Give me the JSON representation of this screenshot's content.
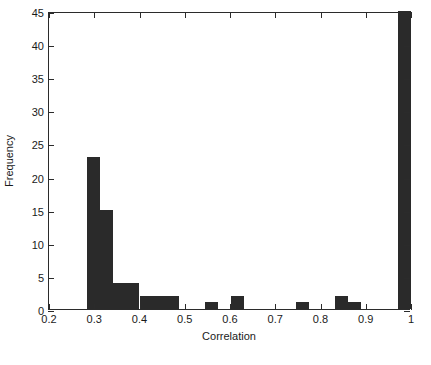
{
  "chart_data": {
    "type": "bar",
    "title": "",
    "subtitle": "",
    "xlabel": "Correlation",
    "ylabel": "Frequency",
    "xlim": [
      0.2,
      1.0
    ],
    "ylim": [
      0,
      45
    ],
    "grid": false,
    "legend": null,
    "legend_position": "none",
    "bar_color": "#2a2a2a",
    "axis_color": "#2b2b2b",
    "background": "#ffffff",
    "xticks": [
      "0.2",
      "0.3",
      "0.4",
      "0.5",
      "0.6",
      "0.7",
      "0.8",
      "0.9",
      "1"
    ],
    "xtick_values": [
      0.2,
      0.3,
      0.4,
      0.5,
      0.6,
      0.7,
      0.8,
      0.9,
      1.0
    ],
    "yticks": [
      "0",
      "5",
      "10",
      "15",
      "20",
      "25",
      "30",
      "35",
      "40",
      "45"
    ],
    "ytick_values": [
      0,
      5,
      10,
      15,
      20,
      25,
      30,
      35,
      40,
      45
    ],
    "bin_width": 0.0288,
    "bins": [
      {
        "x0": 0.2848,
        "x1": 0.3136,
        "value": 23
      },
      {
        "x0": 0.3136,
        "x1": 0.3424,
        "value": 15
      },
      {
        "x0": 0.3424,
        "x1": 0.3712,
        "value": 4
      },
      {
        "x0": 0.3712,
        "x1": 0.4,
        "value": 4
      },
      {
        "x0": 0.4,
        "x1": 0.4288,
        "value": 2
      },
      {
        "x0": 0.4288,
        "x1": 0.4576,
        "value": 2
      },
      {
        "x0": 0.4576,
        "x1": 0.4864,
        "value": 2
      },
      {
        "x0": 0.4864,
        "x1": 0.5152,
        "value": 0
      },
      {
        "x0": 0.5152,
        "x1": 0.544,
        "value": 0
      },
      {
        "x0": 0.544,
        "x1": 0.5728,
        "value": 1
      },
      {
        "x0": 0.5728,
        "x1": 0.6016,
        "value": 0
      },
      {
        "x0": 0.6016,
        "x1": 0.6304,
        "value": 2
      },
      {
        "x0": 0.6304,
        "x1": 0.6592,
        "value": 0
      },
      {
        "x0": 0.6592,
        "x1": 0.688,
        "value": 0
      },
      {
        "x0": 0.688,
        "x1": 0.7168,
        "value": 0
      },
      {
        "x0": 0.7168,
        "x1": 0.7456,
        "value": 0
      },
      {
        "x0": 0.7456,
        "x1": 0.7744,
        "value": 1
      },
      {
        "x0": 0.7744,
        "x1": 0.8032,
        "value": 0
      },
      {
        "x0": 0.8032,
        "x1": 0.832,
        "value": 0
      },
      {
        "x0": 0.832,
        "x1": 0.8608,
        "value": 2
      },
      {
        "x0": 0.8608,
        "x1": 0.8896,
        "value": 1
      },
      {
        "x0": 0.8896,
        "x1": 0.9184,
        "value": 0
      },
      {
        "x0": 0.9184,
        "x1": 0.9472,
        "value": 0
      },
      {
        "x0": 0.9472,
        "x1": 0.9712,
        "value": 0
      },
      {
        "x0": 0.9712,
        "x1": 1.0,
        "value": 45
      }
    ],
    "categories": [
      "0.285-0.314",
      "0.314-0.342",
      "0.342-0.371",
      "0.371-0.400",
      "0.400-0.429",
      "0.429-0.458",
      "0.458-0.486",
      "0.486-0.515",
      "0.515-0.544",
      "0.544-0.573",
      "0.573-0.602",
      "0.602-0.630",
      "0.630-0.659",
      "0.659-0.688",
      "0.688-0.717",
      "0.717-0.746",
      "0.746-0.774",
      "0.774-0.803",
      "0.803-0.832",
      "0.832-0.861",
      "0.861-0.890",
      "0.890-0.918",
      "0.918-0.947",
      "0.947-0.971",
      "0.971-1.000"
    ],
    "values": [
      23,
      15,
      4,
      4,
      2,
      2,
      2,
      0,
      0,
      1,
      0,
      2,
      0,
      0,
      0,
      0,
      1,
      0,
      0,
      2,
      1,
      0,
      0,
      0,
      45
    ]
  },
  "caption": {
    "text": ""
  }
}
